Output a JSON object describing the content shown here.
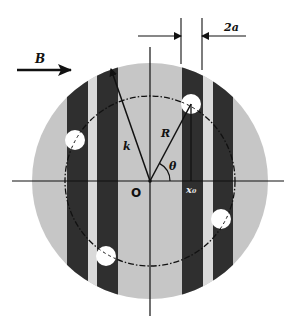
{
  "diagram": {
    "labels": {
      "field": "B",
      "width": "2a",
      "wavevector": "k",
      "radius": "R",
      "angle": "θ",
      "origin": "O",
      "offset": "x₀"
    },
    "colors": {
      "background": "#ffffff",
      "disk": "#c6c6c6",
      "dark_stripe": "#2f2f2f",
      "light_gap": "#dadada",
      "hole": "#ffffff",
      "ink": "#111111"
    },
    "geometry": {
      "center": [
        150,
        181
      ],
      "outer_radius": 118,
      "dashed_circle_radius": 85,
      "hole_radius": 10,
      "holes": [
        [
          191,
          104
        ],
        [
          75,
          140
        ],
        [
          106,
          256
        ],
        [
          221,
          219
        ]
      ],
      "dark_stripes": [
        [
          67,
          88
        ],
        [
          97,
          118
        ],
        [
          182,
          203
        ],
        [
          213,
          233
        ]
      ],
      "light_gaps": [
        [
          88,
          97
        ],
        [
          203,
          213
        ]
      ]
    }
  }
}
